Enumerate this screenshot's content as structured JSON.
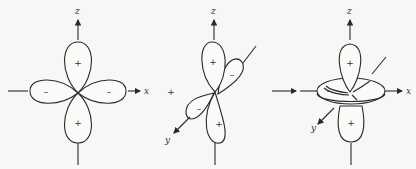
{
  "figures": [
    {
      "id": "orbital-1",
      "description": "Four-lobe cloverleaf orbital in xz plane",
      "axis_labels": {
        "z": "z",
        "x": "x"
      },
      "lobe_signs": {
        "top": "+",
        "bottom": "+",
        "left": "–",
        "right": "–"
      }
    },
    {
      "id": "orbital-2",
      "description": "Four-lobe orbital shown in perspective with y axis",
      "axis_labels": {
        "z": "z",
        "y": "y"
      },
      "lobe_signs": {
        "upper": "+",
        "upper_right": "–",
        "lower_left": "–",
        "lower": "+"
      }
    },
    {
      "id": "orbital-3",
      "description": "Two-lobe orbital along z with toroidal ring in xy plane",
      "axis_labels": {
        "z": "z",
        "x": "x",
        "y": "y"
      },
      "lobe_signs": {
        "top": "+",
        "bottom": "+",
        "ring": "–"
      }
    }
  ],
  "separator": {
    "between_1_2": "x",
    "plus": "+"
  },
  "colors": {
    "stroke": "#2a2a2a",
    "background": "#f7f7f5"
  }
}
